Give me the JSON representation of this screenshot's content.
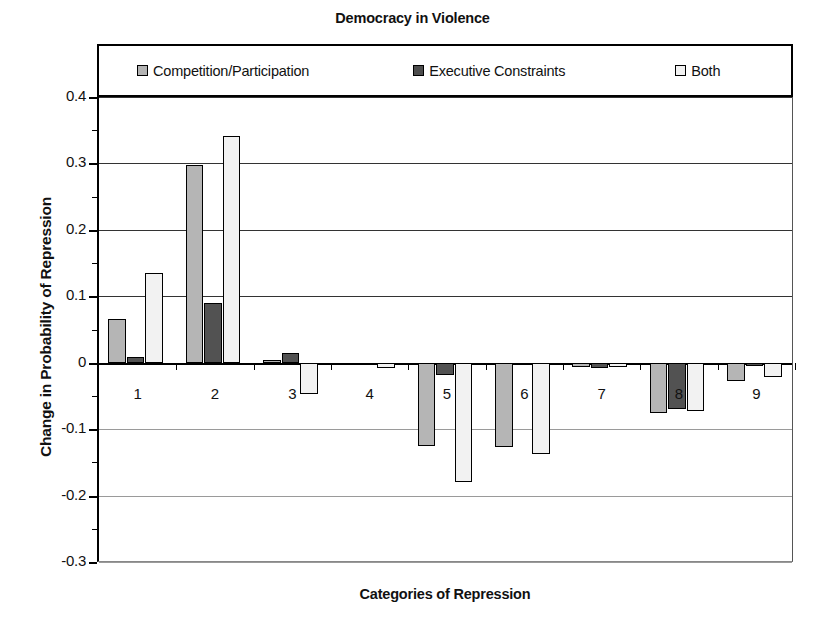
{
  "chart_data": {
    "type": "bar",
    "title": "Democracy in Violence",
    "xlabel": "Categories of Repression",
    "ylabel": "Change in Probability of Repression",
    "categories": [
      "1",
      "2",
      "3",
      "4",
      "5",
      "6",
      "7",
      "8",
      "9"
    ],
    "ylim": [
      -0.3,
      0.4
    ],
    "ytick_labels": [
      "0.4",
      "0.3",
      "0.2",
      "0.1",
      "0",
      "-0.1",
      "-0.2",
      "-0.3"
    ],
    "ytick_values": [
      0.4,
      0.3,
      0.2,
      0.1,
      0,
      -0.1,
      -0.2,
      -0.3
    ],
    "grid": true,
    "legend_position": "top-inside-box",
    "series": [
      {
        "name": "Competition/Participation",
        "color": "#b5b5b5",
        "values": [
          0.066,
          0.298,
          0.004,
          -0.003,
          -0.125,
          -0.127,
          -0.006,
          -0.075,
          -0.027
        ]
      },
      {
        "name": "Executive Constraints",
        "color": "#525252",
        "values": [
          0.008,
          0.09,
          0.014,
          -0.002,
          -0.019,
          -0.004,
          -0.008,
          -0.07,
          -0.005
        ]
      },
      {
        "name": "Both",
        "color": "#f2f2f2",
        "values": [
          0.135,
          0.342,
          -0.047,
          -0.008,
          -0.18,
          -0.137,
          -0.007,
          -0.072,
          -0.022
        ]
      }
    ]
  }
}
